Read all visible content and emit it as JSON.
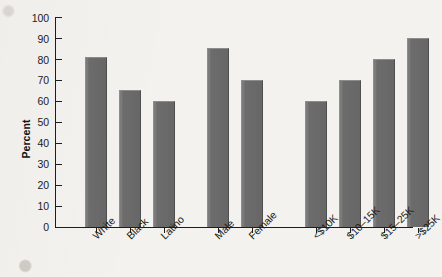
{
  "chart_data": {
    "type": "bar",
    "title": "",
    "subtitle": "",
    "xlabel": "",
    "ylabel": "Percent",
    "ylim": [
      0,
      100
    ],
    "ytick_labels": [
      "100",
      "90",
      "80",
      "70",
      "60",
      "50",
      "40",
      "30",
      "20",
      "10",
      "0"
    ],
    "ytick_values": [
      100,
      90,
      80,
      70,
      60,
      50,
      40,
      30,
      20,
      10,
      0
    ],
    "grid": false,
    "legend": null,
    "legend_position": "none",
    "orientation": "vertical",
    "bar_color": "#6c6c6c",
    "categories": [
      "White",
      "Black",
      "Latino",
      "Male",
      "Female",
      "<$10K",
      "$10–15K",
      "$15–25K",
      ">$25K"
    ],
    "values": [
      81,
      65,
      60,
      85,
      70,
      60,
      70,
      80,
      90
    ],
    "groups": [
      {
        "name": "race-ethnicity",
        "categories": [
          "White",
          "Black",
          "Latino"
        ],
        "values": [
          81,
          65,
          60
        ]
      },
      {
        "name": "gender",
        "categories": [
          "Male",
          "Female"
        ],
        "values": [
          85,
          70
        ]
      },
      {
        "name": "income",
        "categories": [
          "<$10K",
          "$10–15K",
          "$15–25K",
          ">$25K"
        ],
        "values": [
          60,
          70,
          80,
          90
        ]
      }
    ]
  },
  "colors": {
    "bar": "#6c6c6c",
    "axis": "#1d1d1d",
    "text": "#1b1b1b",
    "background": "#f4f2ee"
  }
}
